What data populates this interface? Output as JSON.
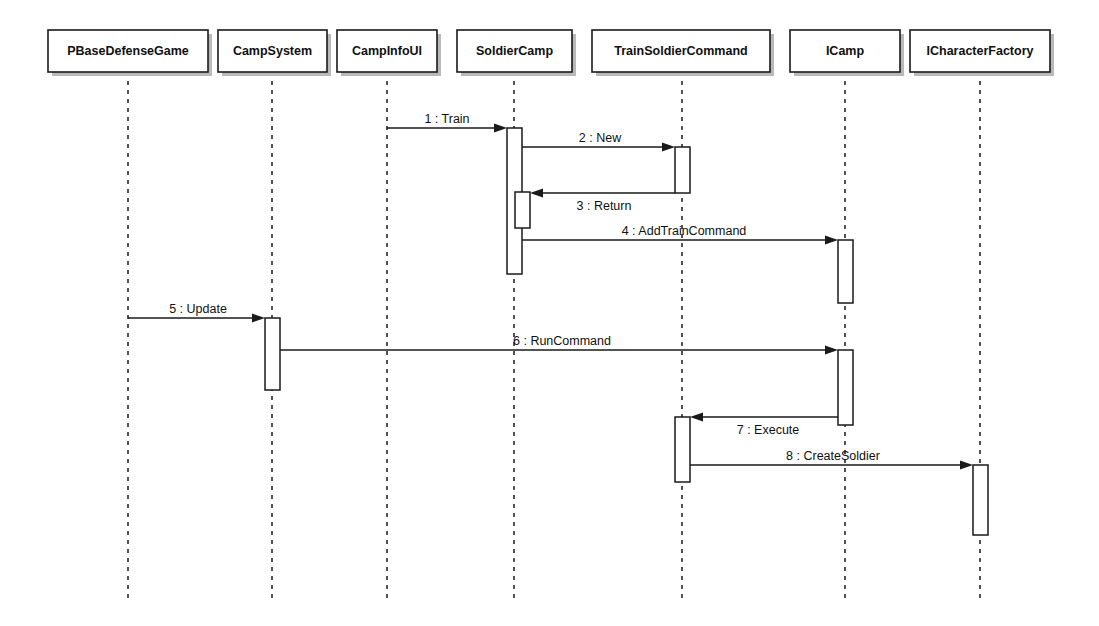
{
  "diagram": {
    "type": "uml-sequence-diagram",
    "title": "",
    "width": 1099,
    "height": 626,
    "background_color": "#ffffff",
    "line_color": "#1a1a1a",
    "shadow_color": "#b9b9b9"
  },
  "participants": [
    {
      "id": "pbasedefensegame",
      "label": "PBaseDefenseGame",
      "box_x": 48,
      "box_y": 30,
      "box_w": 160,
      "box_h": 42,
      "lifeline_x": 128,
      "lifeline_bottom": 600
    },
    {
      "id": "campsystem",
      "label": "CampSystem",
      "box_x": 218,
      "box_y": 30,
      "box_w": 109,
      "box_h": 42,
      "lifeline_x": 272,
      "lifeline_bottom": 600
    },
    {
      "id": "campinfoui",
      "label": "CampInfoUI",
      "box_x": 337,
      "box_y": 30,
      "box_w": 100,
      "box_h": 42,
      "lifeline_x": 387,
      "lifeline_bottom": 600
    },
    {
      "id": "soldiercamp",
      "label": "SoldierCamp",
      "box_x": 457,
      "box_y": 30,
      "box_w": 115,
      "box_h": 42,
      "lifeline_x": 514,
      "lifeline_bottom": 600
    },
    {
      "id": "trainsoldiercommand",
      "label": "TrainSoldierCommand",
      "box_x": 592,
      "box_y": 30,
      "box_w": 178,
      "box_h": 42,
      "lifeline_x": 682,
      "lifeline_bottom": 600
    },
    {
      "id": "icamp",
      "label": "ICamp",
      "box_x": 790,
      "box_y": 30,
      "box_w": 110,
      "box_h": 42,
      "lifeline_x": 845,
      "lifeline_bottom": 600
    },
    {
      "id": "icharacterfactory",
      "label": "ICharacterFactory",
      "box_x": 910,
      "box_y": 30,
      "box_w": 140,
      "box_h": 42,
      "lifeline_x": 980,
      "lifeline_bottom": 600
    }
  ],
  "activations": [
    {
      "id": "act-soldiercamp-main",
      "participant": "soldiercamp",
      "x": 507,
      "y": 128,
      "w": 15,
      "h": 146
    },
    {
      "id": "act-soldiercamp-nested",
      "participant": "soldiercamp",
      "x": 515,
      "y": 192,
      "w": 15,
      "h": 36
    },
    {
      "id": "act-trainsoldier-1",
      "participant": "trainsoldiercommand",
      "x": 675,
      "y": 147,
      "w": 15,
      "h": 46
    },
    {
      "id": "act-icamp-1",
      "participant": "icamp",
      "x": 838,
      "y": 240,
      "w": 15,
      "h": 63
    },
    {
      "id": "act-campsystem-1",
      "participant": "campsystem",
      "x": 265,
      "y": 318,
      "w": 15,
      "h": 72
    },
    {
      "id": "act-icamp-2",
      "participant": "icamp",
      "x": 838,
      "y": 350,
      "w": 15,
      "h": 75
    },
    {
      "id": "act-trainsoldier-2",
      "participant": "trainsoldiercommand",
      "x": 675,
      "y": 417,
      "w": 15,
      "h": 65
    },
    {
      "id": "act-icharacterfactory-1",
      "participant": "icharacterfactory",
      "x": 973,
      "y": 465,
      "w": 15,
      "h": 70
    }
  ],
  "messages": [
    {
      "seq": "1",
      "name": "Train",
      "label": "1 : Train",
      "from": "campinfoui",
      "to": "soldiercamp",
      "x1": 387,
      "x2": 507,
      "y": 128,
      "dir": "right",
      "label_x": 447,
      "label_y": 123
    },
    {
      "seq": "2",
      "name": "New",
      "label": "2 : New",
      "from": "soldiercamp",
      "to": "trainsoldiercommand",
      "x1": 522,
      "x2": 675,
      "y": 147,
      "dir": "right",
      "label_x": 600,
      "label_y": 142
    },
    {
      "seq": "3",
      "name": "Return",
      "label": "3 : Return",
      "from": "trainsoldiercommand",
      "to": "soldiercamp",
      "x1": 675,
      "x2": 530,
      "y": 193,
      "dir": "left",
      "label_x": 604,
      "label_y": 210
    },
    {
      "seq": "4",
      "name": "AddTrainCommand",
      "label": "4 : AddTrainCommand",
      "from": "soldiercamp",
      "to": "icamp",
      "x1": 522,
      "x2": 838,
      "y": 240,
      "dir": "right",
      "label_x": 684,
      "label_y": 235
    },
    {
      "seq": "5",
      "name": "Update",
      "label": "5 : Update",
      "from": "pbasedefensegame",
      "to": "campsystem",
      "x1": 128,
      "x2": 265,
      "y": 318,
      "dir": "right",
      "label_x": 198,
      "label_y": 313
    },
    {
      "seq": "6",
      "name": "RunCommand",
      "label": "6 : RunCommand",
      "from": "campsystem",
      "to": "icamp",
      "x1": 280,
      "x2": 838,
      "y": 350,
      "dir": "right",
      "label_x": 562,
      "label_y": 345
    },
    {
      "seq": "7",
      "name": "Execute",
      "label": "7 : Execute",
      "from": "icamp",
      "to": "trainsoldiercommand",
      "x1": 838,
      "x2": 690,
      "y": 417,
      "dir": "left",
      "label_x": 768,
      "label_y": 434
    },
    {
      "seq": "8",
      "name": "CreateSoldier",
      "label": "8 : CreateSoldier",
      "from": "trainsoldiercommand",
      "to": "icharacterfactory",
      "x1": 690,
      "x2": 973,
      "y": 465,
      "dir": "right",
      "label_x": 833,
      "label_y": 460
    }
  ]
}
